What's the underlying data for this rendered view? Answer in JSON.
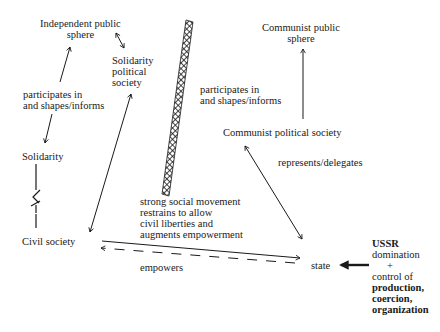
{
  "diagram": {
    "nodes": {
      "independent_public_sphere": "Independent public\nsphere",
      "solidarity_political_society": "Solidarity\npolitical\nsociety",
      "solidarity": "Solidarity",
      "civil_society": "Civil society",
      "communist_public_sphere": "Communist public\nsphere",
      "communist_political_society": "Communist political society",
      "state": "state",
      "ussr_title": "USSR",
      "ussr_line1": "domination",
      "ussr_plus": "+",
      "ussr_line2": "control of",
      "ussr_bold": "production,\ncoercion,\norganization"
    },
    "edge_labels": {
      "left_participates": "participates in\nand shapes/informs",
      "right_participates": "participates in\nand shapes/informs",
      "represents": "represents/delegates",
      "movement": "strong social movement\nrestrains to allow\ncivil liberties and\naugments empowerment",
      "empowers": "empowers"
    },
    "edges": [
      {
        "from": "participates (left)",
        "to": "Independent public sphere",
        "style": "arrow"
      },
      {
        "from": "participates (left)",
        "to": "Solidarity",
        "style": "arrow"
      },
      {
        "from": "Independent public sphere",
        "to": "Solidarity political society",
        "style": "double-arrow"
      },
      {
        "from": "Solidarity political society",
        "to": "Civil society",
        "style": "double-arrow"
      },
      {
        "from": "Solidarity",
        "to": "Civil society",
        "style": "dialectic-link"
      },
      {
        "from": "Communist political society",
        "to": "Communist public sphere",
        "style": "arrow"
      },
      {
        "from": "Communist political society",
        "to": "state",
        "style": "double-arrow"
      },
      {
        "from": "Civil society",
        "to": "state",
        "style": "solid-arrow"
      },
      {
        "from": "state",
        "to": "Civil society",
        "style": "dashed-arrow"
      },
      {
        "from": "USSR domination",
        "to": "state",
        "style": "bold-arrow"
      }
    ],
    "barrier": "hatched-wall"
  }
}
